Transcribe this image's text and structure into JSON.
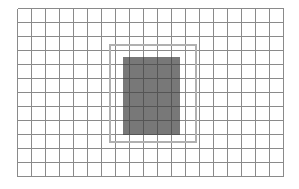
{
  "figure": {
    "background_color": "#ffffff",
    "canvas": {
      "width": 299,
      "height": 189
    }
  },
  "grid": {
    "name": "background-grid",
    "origin_x": 17,
    "origin_y": 8,
    "columns": 19,
    "rows": 12,
    "cell_width": 14,
    "cell_height": 14,
    "line_color": "#8a8a8a",
    "line_width": 1,
    "fill_color": "#ffffff",
    "total_width": 266,
    "total_height": 168
  },
  "outline_region": {
    "name": "outline-rectangle",
    "x": 109,
    "y": 44,
    "width": 86,
    "height": 97,
    "stroke_color": "#b0b0b0",
    "stroke_width": 2,
    "fill_color": "none",
    "columns_spanned": 6,
    "rows_spanned": 7
  },
  "filled_region": {
    "name": "filled-rectangle",
    "x": 123,
    "y": 57,
    "width": 57,
    "height": 78,
    "fill_color": "#787878",
    "stroke_color": "none",
    "columns_spanned": 4,
    "rows_spanned": 5
  },
  "overlay_grid": {
    "name": "overlay-grid-lines",
    "line_color": "#555555",
    "line_width": 1
  }
}
